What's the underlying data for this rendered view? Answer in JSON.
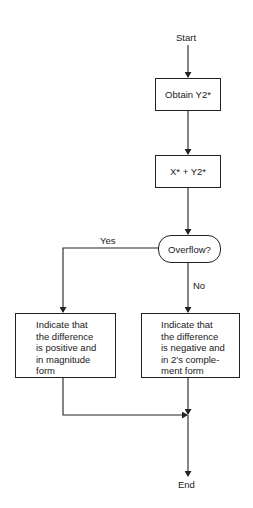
{
  "diagram": {
    "type": "flowchart",
    "nodes": {
      "start": "Start",
      "obtain": "Obtain Y2*",
      "add": "X* + Y2*",
      "decision": "Overflow?",
      "positive": {
        "lines": [
          "Indicate that",
          "the difference",
          "is positive and",
          "in magnitude",
          "form"
        ]
      },
      "negative": {
        "lines": [
          "Indicate that",
          "the difference",
          "is negative and",
          "in 2's comple-",
          "ment form"
        ]
      },
      "end": "End"
    },
    "edges": {
      "yes_label": "Yes",
      "no_label": "No"
    },
    "colors": {
      "line": "#222222",
      "background": "#ffffff"
    }
  }
}
